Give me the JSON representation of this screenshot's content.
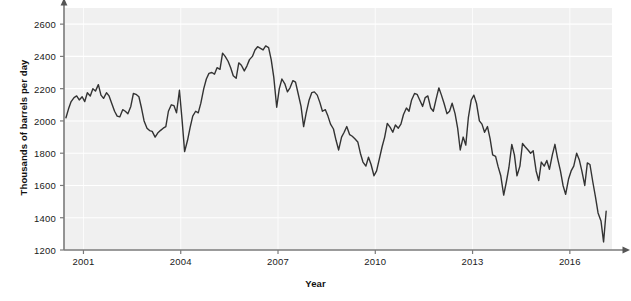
{
  "chart": {
    "ylabel": "Thousands of barrels per day",
    "xlabel": "Year",
    "title": ""
  },
  "chart_data": {
    "type": "line",
    "title": "",
    "xlabel": "Year",
    "ylabel": "Thousands of barrels per day",
    "xlim": [
      2000.4,
      2017.3
    ],
    "ylim": [
      1200,
      2700
    ],
    "xticks": [
      2001,
      2004,
      2007,
      2010,
      2013,
      2016
    ],
    "xtick_labels": [
      "2001",
      "2004",
      "2007",
      "2010",
      "2013",
      "2016"
    ],
    "yticks": [
      1200,
      1400,
      1600,
      1800,
      2000,
      2200,
      2400,
      2600
    ],
    "ytick_labels": [
      "1200",
      "1400",
      "1600",
      "1800",
      "2000",
      "2200",
      "2400",
      "2600"
    ],
    "grid": true,
    "grid_color": "#ffffff",
    "panel_background": "#f0f0f0",
    "legend": null,
    "series": [
      {
        "name": "Production",
        "color": "#333333",
        "line_width": 1.4,
        "x": [
          2000.46,
          2000.54,
          2000.62,
          2000.71,
          2000.79,
          2000.87,
          2000.96,
          2001.04,
          2001.12,
          2001.21,
          2001.29,
          2001.37,
          2001.46,
          2001.54,
          2001.62,
          2001.71,
          2001.79,
          2001.87,
          2001.96,
          2002.04,
          2002.12,
          2002.21,
          2002.29,
          2002.37,
          2002.46,
          2002.54,
          2002.62,
          2002.71,
          2002.79,
          2002.87,
          2002.96,
          2003.04,
          2003.12,
          2003.21,
          2003.29,
          2003.37,
          2003.46,
          2003.54,
          2003.62,
          2003.71,
          2003.79,
          2003.87,
          2003.96,
          2004.04,
          2004.12,
          2004.21,
          2004.29,
          2004.37,
          2004.46,
          2004.54,
          2004.62,
          2004.71,
          2004.79,
          2004.87,
          2004.96,
          2005.04,
          2005.12,
          2005.21,
          2005.29,
          2005.37,
          2005.46,
          2005.54,
          2005.62,
          2005.71,
          2005.79,
          2005.87,
          2005.96,
          2006.04,
          2006.12,
          2006.21,
          2006.29,
          2006.37,
          2006.46,
          2006.54,
          2006.62,
          2006.71,
          2006.79,
          2006.87,
          2006.96,
          2007.04,
          2007.12,
          2007.21,
          2007.29,
          2007.37,
          2007.46,
          2007.54,
          2007.62,
          2007.71,
          2007.79,
          2007.87,
          2007.96,
          2008.04,
          2008.12,
          2008.21,
          2008.29,
          2008.37,
          2008.46,
          2008.54,
          2008.62,
          2008.71,
          2008.79,
          2008.87,
          2008.96,
          2009.04,
          2009.12,
          2009.21,
          2009.29,
          2009.37,
          2009.46,
          2009.54,
          2009.62,
          2009.71,
          2009.79,
          2009.87,
          2009.96,
          2010.04,
          2010.12,
          2010.21,
          2010.29,
          2010.37,
          2010.46,
          2010.54,
          2010.62,
          2010.71,
          2010.79,
          2010.87,
          2010.96,
          2011.04,
          2011.12,
          2011.21,
          2011.29,
          2011.37,
          2011.46,
          2011.54,
          2011.62,
          2011.71,
          2011.79,
          2011.87,
          2011.96,
          2012.04,
          2012.12,
          2012.21,
          2012.29,
          2012.37,
          2012.46,
          2012.54,
          2012.62,
          2012.71,
          2012.79,
          2012.87,
          2012.96,
          2013.04,
          2013.12,
          2013.21,
          2013.29,
          2013.37,
          2013.46,
          2013.54,
          2013.62,
          2013.71,
          2013.79,
          2013.87,
          2013.96,
          2014.04,
          2014.12,
          2014.21,
          2014.29,
          2014.37,
          2014.46,
          2014.54,
          2014.62,
          2014.71,
          2014.79,
          2014.87,
          2014.96,
          2015.04,
          2015.12,
          2015.21,
          2015.29,
          2015.37,
          2015.46,
          2015.54,
          2015.62,
          2015.71,
          2015.79,
          2015.87,
          2015.96,
          2016.04,
          2016.12,
          2016.21,
          2016.29,
          2016.37,
          2016.46,
          2016.54,
          2016.62,
          2016.71,
          2016.79,
          2016.87,
          2016.96,
          2017.04,
          2017.12
        ],
        "y": [
          2020,
          2075,
          2120,
          2145,
          2155,
          2130,
          2150,
          2120,
          2175,
          2155,
          2200,
          2185,
          2225,
          2160,
          2140,
          2175,
          2155,
          2110,
          2060,
          2030,
          2025,
          2070,
          2060,
          2045,
          2090,
          2170,
          2165,
          2150,
          2080,
          2000,
          1955,
          1940,
          1935,
          1900,
          1925,
          1940,
          1955,
          1965,
          2060,
          2100,
          2095,
          2050,
          2190,
          2010,
          1810,
          1880,
          1960,
          2030,
          2060,
          2050,
          2110,
          2200,
          2260,
          2295,
          2300,
          2290,
          2330,
          2320,
          2420,
          2400,
          2370,
          2330,
          2280,
          2265,
          2360,
          2345,
          2310,
          2340,
          2380,
          2400,
          2440,
          2460,
          2450,
          2440,
          2465,
          2455,
          2380,
          2270,
          2085,
          2200,
          2260,
          2230,
          2180,
          2205,
          2250,
          2240,
          2170,
          2090,
          1965,
          2050,
          2130,
          2175,
          2180,
          2160,
          2115,
          2060,
          2070,
          2030,
          1980,
          1950,
          1880,
          1820,
          1900,
          1930,
          1965,
          1915,
          1905,
          1890,
          1870,
          1800,
          1745,
          1720,
          1775,
          1730,
          1660,
          1690,
          1760,
          1840,
          1900,
          1985,
          1960,
          1930,
          1975,
          1955,
          1980,
          2040,
          2080,
          2060,
          2130,
          2170,
          2165,
          2130,
          2090,
          2145,
          2155,
          2080,
          2060,
          2130,
          2205,
          2160,
          2110,
          2045,
          2060,
          2110,
          2045,
          1955,
          1820,
          1900,
          1850,
          2020,
          2130,
          2160,
          2110,
          2000,
          1980,
          1930,
          1965,
          1890,
          1790,
          1780,
          1715,
          1660,
          1540,
          1620,
          1710,
          1855,
          1790,
          1660,
          1720,
          1860,
          1840,
          1820,
          1800,
          1815,
          1690,
          1630,
          1745,
          1720,
          1755,
          1700,
          1790,
          1855,
          1770,
          1690,
          1600,
          1545,
          1640,
          1690,
          1720,
          1800,
          1760,
          1690,
          1600,
          1740,
          1730,
          1620,
          1530,
          1430,
          1380,
          1250,
          1440
        ]
      }
    ]
  }
}
